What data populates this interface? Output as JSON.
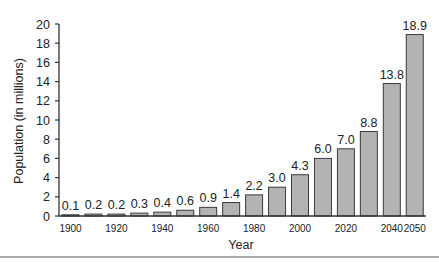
{
  "chart_data": {
    "type": "bar",
    "title": "",
    "xlabel": "Year",
    "ylabel": "Population (in millions)",
    "ylim": [
      0,
      20
    ],
    "yticks": [
      0,
      2,
      4,
      6,
      8,
      10,
      12,
      14,
      16,
      18,
      20
    ],
    "grid": false,
    "legend": null,
    "categories": [
      "1900",
      "1910",
      "1920",
      "1930",
      "1940",
      "1950",
      "1960",
      "1970",
      "1980",
      "1990",
      "2000",
      "2010",
      "2020",
      "2030",
      "2040",
      "2050"
    ],
    "values": [
      0.1,
      0.2,
      0.2,
      0.3,
      0.4,
      0.6,
      0.9,
      1.4,
      2.2,
      3.0,
      4.3,
      6.0,
      7.0,
      8.8,
      13.8,
      18.9
    ],
    "value_labels": [
      "0.1",
      "0.2",
      "0.2",
      "0.3",
      "0.4",
      "0.6",
      "0.9",
      "1.4",
      "2.2",
      "3.0",
      "4.3",
      "6.0",
      "7.0",
      "8.8",
      "13.8",
      "18.9"
    ],
    "xtick_labels_shown": {
      "1900": "1900",
      "1920": "1920",
      "1940": "1940",
      "1960": "1960",
      "1980": "1980",
      "2000": "2000",
      "2020": "2020",
      "2040": "2040",
      "2050": "2050"
    },
    "bar_color": "#b3b3b3",
    "bar_edge_color": "#3a3a3a"
  }
}
